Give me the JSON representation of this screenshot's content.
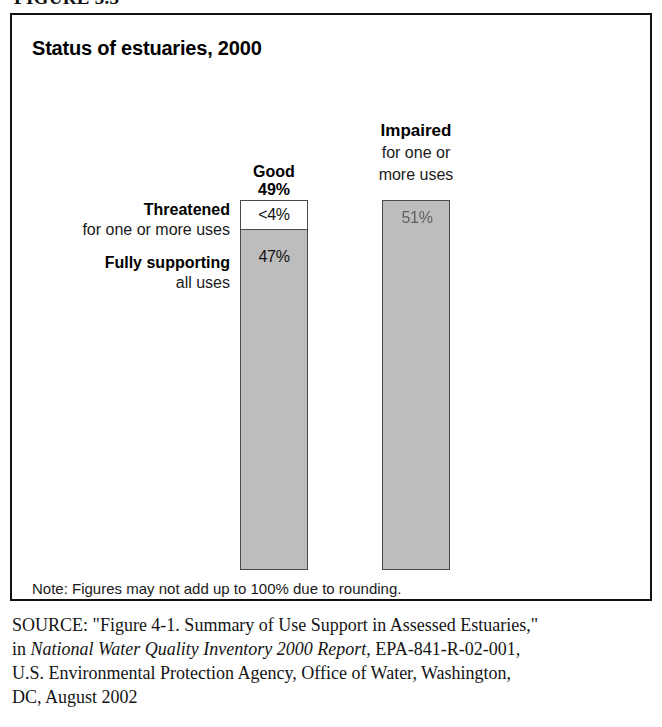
{
  "figure": {
    "caption": "FIGURE 3.3"
  },
  "panel": {
    "title": "Status of estuaries, 2000"
  },
  "chart_data": {
    "type": "bar",
    "title": "Status of estuaries, 2000",
    "xlabel": "",
    "ylabel": "",
    "ylim": [
      0,
      51
    ],
    "grid": false,
    "legend_position": "none",
    "note": "Note: Figures may not add up to 100% due to rounding.",
    "categories": [
      "Good",
      "Impaired"
    ],
    "category_sublabels": [
      "",
      "for one or more uses"
    ],
    "category_totals": [
      "49%",
      "51%"
    ],
    "series": [
      {
        "name": "Fully supporting all uses",
        "category": "Good",
        "value": 47,
        "value_label": "47%",
        "label_main": "Fully supporting",
        "label_sub": "all uses",
        "color": "#bdbdbd"
      },
      {
        "name": "Threatened for one or more uses",
        "category": "Good",
        "value": 4,
        "value_label": "<4%",
        "label_main": "Threatened",
        "label_sub": "for one or more uses",
        "color": "#ffffff"
      },
      {
        "name": "Impaired for one or more uses",
        "category": "Impaired",
        "value": 51,
        "value_label": "51%",
        "label_main": "Impaired",
        "label_sub": "for one or more uses",
        "color": "#bdbdbd"
      }
    ]
  },
  "bars": {
    "good": {
      "header_main": "Good",
      "header_value": "49%",
      "threatened_value": "<4%",
      "supporting_value": "47%"
    },
    "impaired": {
      "header_main": "Impaired",
      "header_sub_line1": "for one or",
      "header_sub_line2": "more uses",
      "value": "51%"
    }
  },
  "side_labels": {
    "threatened": {
      "main": "Threatened",
      "sub": "for one or more uses"
    },
    "supporting": {
      "main": "Fully supporting",
      "sub": "all uses"
    }
  },
  "note": "Note: Figures may not add up to 100% due to rounding.",
  "source": {
    "keyword": "SOURCE:",
    "line1_pre": " \"Figure 4-1. Summary of Use Support in Assessed Estuaries,\"",
    "line2_pre": "in ",
    "line2_italic": "National Water Quality Inventory 2000 Report,",
    "line2_post": " EPA-841-R-02-001,",
    "line3": "U.S. Environmental Protection Agency, Office of Water, Washington,",
    "line4": "DC, August 2002"
  },
  "colors": {
    "bar_fill": "#bdbdbd",
    "bar_border": "#4a4a4a",
    "panel_border": "#111111",
    "white_segment": "#ffffff"
  }
}
